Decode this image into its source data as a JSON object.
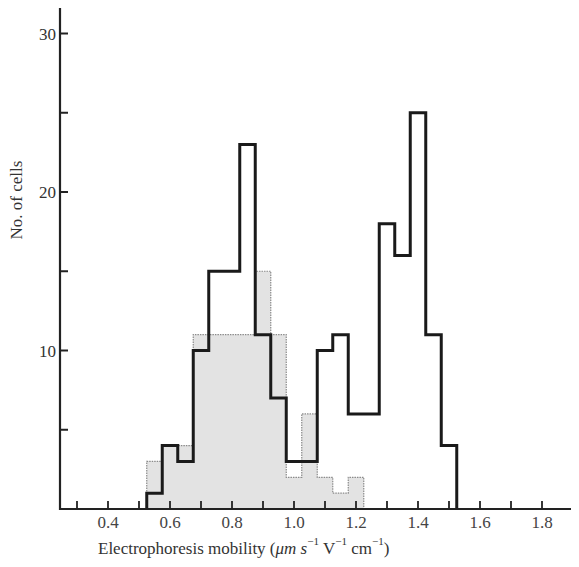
{
  "chart_data": {
    "type": "bar",
    "subtype": "histogram-step-overlay",
    "title": "",
    "xlabel": "Electrophoresis mobility (μm s⁻¹ V⁻¹ cm⁻¹)",
    "xlabel_parts": {
      "main": "Electrophoresis mobility (",
      "unit1": "μm s",
      "exp1": "−1",
      "unit2": " V",
      "exp2": "−1",
      "unit3": " cm",
      "exp3": "−1",
      "close": ")"
    },
    "ylabel": "No. of cells",
    "xlim": [
      0.25,
      1.9
    ],
    "ylim": [
      0,
      31
    ],
    "x_ticks": [
      0.3,
      0.4,
      0.5,
      0.6,
      0.7,
      0.8,
      0.9,
      1.0,
      1.1,
      1.2,
      1.3,
      1.4,
      1.5,
      1.6,
      1.7,
      1.8
    ],
    "x_tick_labels": [
      "0.4",
      "0.6",
      "0.8",
      "1.0",
      "1.2",
      "1.4",
      "1.6",
      "1.8"
    ],
    "x_tick_label_values": [
      0.4,
      0.6,
      0.8,
      1.0,
      1.2,
      1.4,
      1.6,
      1.8
    ],
    "y_ticks": [
      5,
      10,
      15,
      20,
      25,
      30
    ],
    "y_tick_labels": [
      "10",
      "20",
      "30"
    ],
    "y_tick_label_values": [
      10,
      20,
      30
    ],
    "grid": false,
    "legend": null,
    "bin_width": 0.05,
    "categories": [
      0.55,
      0.6,
      0.65,
      0.7,
      0.75,
      0.8,
      0.85,
      0.9,
      0.95,
      1.0,
      1.05,
      1.1,
      1.15,
      1.2,
      1.25,
      1.3,
      1.35,
      1.4,
      1.45,
      1.5
    ],
    "series": [
      {
        "name": "Total population (bold outline)",
        "style": "bold-step",
        "values": [
          1,
          4,
          3,
          10,
          15,
          15,
          23,
          11,
          7,
          3,
          3,
          10,
          11,
          6,
          6,
          18,
          16,
          25,
          11,
          4
        ]
      },
      {
        "name": "Subpopulation (shaded)",
        "style": "shaded-step",
        "values": [
          3,
          4,
          4,
          11,
          11,
          11,
          11,
          15,
          11,
          2,
          6,
          2,
          1,
          2,
          0,
          0,
          0,
          0,
          0,
          0
        ]
      }
    ],
    "colors": {
      "line": "#1a1a1a",
      "shade": "#e3e3e3",
      "shade_edge": "#8a8a8a",
      "axis": "#222222"
    }
  }
}
